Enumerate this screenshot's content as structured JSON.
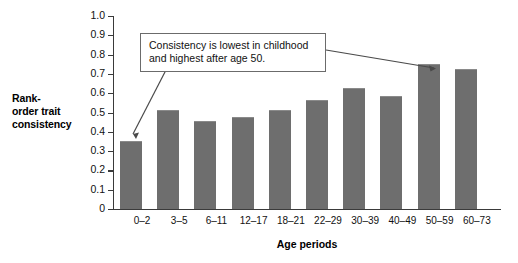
{
  "chart_data": {
    "type": "bar",
    "title": "",
    "categories": [
      "0–2",
      "3–5",
      "6–11",
      "12–17",
      "18–21",
      "22–29",
      "30–39",
      "40–49",
      "50–59",
      "60–73"
    ],
    "values": [
      0.35,
      0.515,
      0.455,
      0.475,
      0.515,
      0.565,
      0.625,
      0.585,
      0.75,
      0.725
    ],
    "xlabel": "Age periods",
    "ylabel": "Rank-order trait consistency",
    "ylim": [
      0,
      1.0
    ],
    "ytick_labels": [
      "1.0",
      "0.9",
      "0.8",
      "0.7",
      "0.6",
      "0.5",
      "0.4",
      "0.3",
      "0.2",
      "0.1",
      "0"
    ],
    "ytick_values": [
      1.0,
      0.9,
      0.8,
      0.7,
      0.6,
      0.5,
      0.4,
      0.3,
      0.2,
      0.1,
      0.0
    ],
    "grid": false,
    "legend": false,
    "bar_color": "#6e6e6e",
    "axis_color": "#3a3a3a",
    "annotations": [
      {
        "text": "Consistency is lowest in childhood and highest after age 50.",
        "line1": "Consistency is lowest in childhood",
        "line2": "and highest after age 50.",
        "points_to": [
          "0–2",
          "50–59"
        ]
      }
    ]
  },
  "axes": {
    "y_title_line1": "Rank-",
    "y_title_line2": "order trait",
    "y_title_line3": "consistency",
    "x_title": "Age periods"
  },
  "annotation": {
    "line1": "Consistency is lowest in childhood",
    "line2": "and highest after age 50."
  }
}
